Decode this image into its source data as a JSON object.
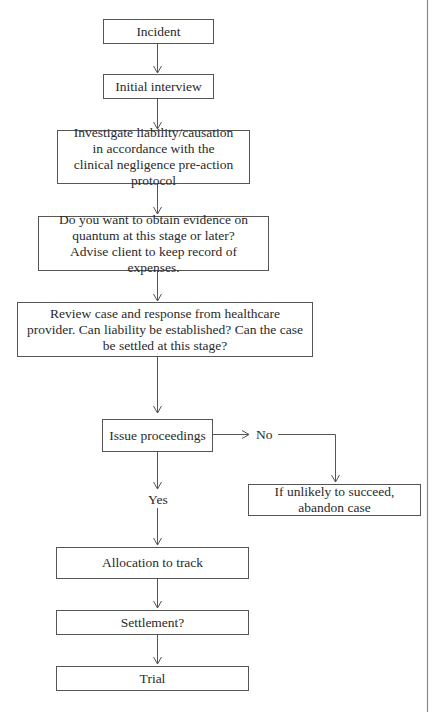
{
  "diagram": {
    "type": "flowchart",
    "nodes": {
      "incident": "Incident",
      "initial_interview": "Initial interview",
      "investigate": "Investigate liability/causation in accordance with the clinical negligence pre-action protocol",
      "quantum": "Do you want to obtain evidence on quantum at this stage or later? Advise client to keep record of expenses.",
      "review": "Review case and response from healthcare provider. Can liability be established? Can the case be settled at this stage?",
      "issue_proceedings": "Issue proceedings",
      "abandon": "If unlikely to succeed, abandon case",
      "allocation": "Allocation to track",
      "settlement": "Settlement?",
      "trial": "Trial"
    },
    "branch_labels": {
      "no": "No",
      "yes": "Yes"
    },
    "edges": [
      {
        "from": "incident",
        "to": "initial_interview"
      },
      {
        "from": "initial_interview",
        "to": "investigate"
      },
      {
        "from": "investigate",
        "to": "quantum"
      },
      {
        "from": "quantum",
        "to": "review"
      },
      {
        "from": "review",
        "to": "issue_proceedings"
      },
      {
        "from": "issue_proceedings",
        "to": "abandon",
        "label": "No"
      },
      {
        "from": "issue_proceedings",
        "to": "allocation",
        "label": "Yes"
      },
      {
        "from": "allocation",
        "to": "settlement"
      },
      {
        "from": "settlement",
        "to": "trial"
      }
    ]
  }
}
